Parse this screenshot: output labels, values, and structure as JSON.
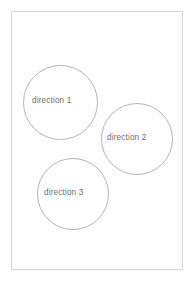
{
  "canvas": {
    "width": 194,
    "height": 282,
    "background_color": "#ffffff"
  },
  "frame": {
    "name": "slide-frame",
    "border_color": "#d6d6d6",
    "fill_color": "#fefefe"
  },
  "style": {
    "circle_stroke_color": "#b5b5b5",
    "circle_fill_color": "transparent",
    "label_text_color": "#6f6f6f"
  },
  "diagram": {
    "type": "venn-like-circles",
    "nodes": [
      {
        "id": "circle-1",
        "label": "direction 1",
        "center_x": 59,
        "center_y": 101,
        "diameter": 75
      },
      {
        "id": "circle-2",
        "label": "direction 2",
        "center_x": 136,
        "center_y": 138,
        "diameter": 72
      },
      {
        "id": "circle-3",
        "label": "direction 3",
        "center_x": 72,
        "center_y": 193,
        "diameter": 72
      }
    ]
  }
}
